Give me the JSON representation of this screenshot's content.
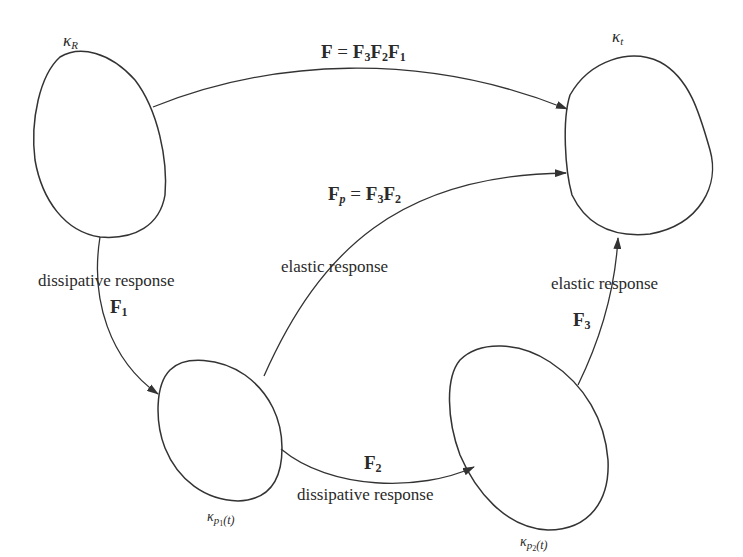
{
  "diagram": {
    "nodes": {
      "kappa_R": {
        "symbol": "κ",
        "sub": "R"
      },
      "kappa_t": {
        "symbol": "κ",
        "sub": "t"
      },
      "kappa_p1": {
        "symbol": "κ",
        "sub": "p",
        "subsub": "1",
        "arg": "(t)"
      },
      "kappa_p2": {
        "symbol": "κ",
        "sub": "p",
        "subsub": "2",
        "arg": "(t)"
      }
    },
    "edges": {
      "F_total": {
        "lhs": "F",
        "eq": " = ",
        "t1": "F",
        "t1_sub": "3",
        "t2": "F",
        "t2_sub": "2",
        "t3": "F",
        "t3_sub": "1"
      },
      "F_p": {
        "lhs": "F",
        "lhs_sub": "p",
        "eq": " = ",
        "t1": "F",
        "t1_sub": "3",
        "t2": "F",
        "t2_sub": "2",
        "caption": "elastic response"
      },
      "F_1": {
        "sym": "F",
        "sub": "1",
        "caption": "dissipative response"
      },
      "F_2": {
        "sym": "F",
        "sub": "2",
        "caption": "dissipative response"
      },
      "F_3": {
        "sym": "F",
        "sub": "3",
        "caption": "elastic response"
      }
    },
    "colors": {
      "stroke": "#333333",
      "text": "#2a2a2a",
      "background": "#ffffff"
    }
  }
}
